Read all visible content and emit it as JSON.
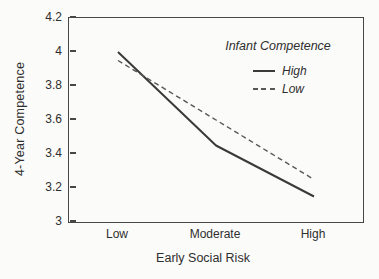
{
  "chart_data": {
    "type": "line",
    "title": "",
    "xlabel": "Early Social Risk",
    "ylabel": "4-Year Competence",
    "categories": [
      "Low",
      "Moderate",
      "High"
    ],
    "series": [
      {
        "name": "High",
        "style": "solid",
        "values": [
          4.0,
          3.45,
          3.15
        ]
      },
      {
        "name": "Low",
        "style": "dashed",
        "values": [
          3.95,
          3.6,
          3.25
        ]
      }
    ],
    "legend_title": "Infant Competence",
    "legend_position": "top-right-inside",
    "ylim": [
      3.0,
      4.2
    ],
    "ytick_labels": [
      "4.2",
      "4",
      "3.8",
      "3.6",
      "3.4",
      "3.2",
      "3"
    ],
    "grid": false,
    "colors": {
      "line_high": "#3a3a3a",
      "line_low": "#575757",
      "axis": "#474747",
      "text": "#2e2e2e",
      "background": "#fbfbf9"
    }
  }
}
